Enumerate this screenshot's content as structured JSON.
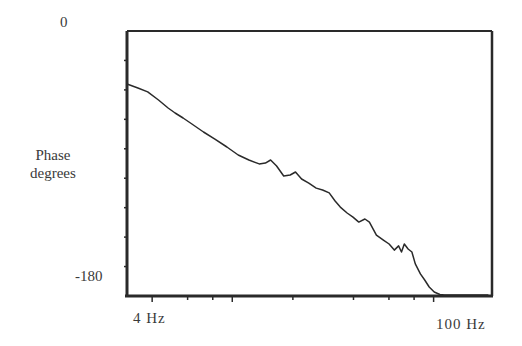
{
  "chart_data": {
    "type": "line",
    "title": "",
    "xlabel": "",
    "ylabel": "Phase degrees",
    "x_scale": "log",
    "x_tick_labels": [
      "4 Hz",
      "100 Hz"
    ],
    "y_tick_labels": [
      "0",
      "-180"
    ],
    "xlim_hz": [
      3.0,
      195
    ],
    "ylim": [
      -180,
      0
    ],
    "y_minor_tick_step": 20,
    "grid": false,
    "legend": null,
    "series": [
      {
        "name": "Phase",
        "x_hz": [
          3.0,
          3.4,
          3.8,
          4.3,
          4.8,
          5.2,
          5.7,
          6.3,
          7.2,
          8.2,
          9.4,
          10.7,
          12.1,
          13.6,
          14.6,
          15.5,
          16.6,
          18.0,
          19.4,
          20.6,
          22.1,
          24.0,
          26.1,
          28.1,
          30.3,
          32.4,
          34.4,
          37.2,
          39.8,
          42.5,
          45.6,
          48.0,
          52.0,
          56.3,
          60.1,
          63.8,
          67.0,
          69.3,
          71.5,
          74.7,
          78.0,
          81.1,
          86.0,
          90.3,
          95.1,
          100.7,
          107.5,
          113.1,
          118.9,
          126.3,
          134.2,
          141.5,
          149.3,
          155.1,
          158.7,
          164.2,
          171.5,
          187.2
        ],
        "y_deg": [
          -36.0,
          -38.7,
          -41.4,
          -46.9,
          -52.3,
          -55.7,
          -59.1,
          -63.2,
          -68.6,
          -73.4,
          -78.8,
          -84.2,
          -87.6,
          -90.3,
          -89.7,
          -87.6,
          -91.7,
          -98.5,
          -97.8,
          -95.8,
          -100.5,
          -103.3,
          -106.7,
          -108.0,
          -110.0,
          -115.5,
          -119.6,
          -123.6,
          -126.4,
          -129.8,
          -127.7,
          -129.8,
          -138.6,
          -142.0,
          -144.7,
          -148.8,
          -146.0,
          -150.1,
          -144.7,
          -148.1,
          -150.1,
          -158.2,
          -165.0,
          -169.1,
          -173.9,
          -177.3,
          -179.0,
          -180.4,
          -181.1,
          -181.7,
          -183.1,
          -180.4,
          -180.4,
          -183.1,
          -181.7,
          -180.4,
          -179.7,
          -180.4
        ]
      }
    ]
  },
  "labels": {
    "y_top": "0",
    "y_bottom": "-180",
    "y_title_line1": "Phase",
    "y_title_line2": "degrees",
    "x_left": "4  Hz",
    "x_right": "100  Hz"
  },
  "colors": {
    "ink": "#2a2a2a",
    "background": "#ffffff"
  }
}
